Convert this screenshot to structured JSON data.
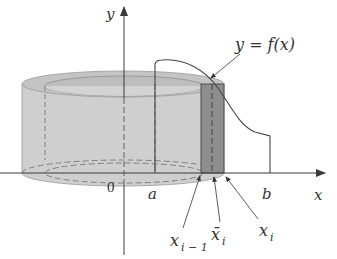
{
  "figure": {
    "colors": {
      "background": "#ffffff",
      "axis": "#3a3a3a",
      "curve": "#4a4a4a",
      "shell_fill": "#c9c9c9",
      "shell_top": "#bdbdbd",
      "strip_fill": "#8d8d8d",
      "dash": "#666666"
    },
    "labels": {
      "y_axis": "y",
      "x_axis": "x",
      "origin": "0",
      "a": "a",
      "b": "b",
      "function": "y = f(x)",
      "x_prev_main": "x",
      "x_prev_sub": "i − 1",
      "x_bar_main": "x̄",
      "x_bar_sub": "i",
      "x_i_main": "x",
      "x_i_sub": "i"
    }
  }
}
